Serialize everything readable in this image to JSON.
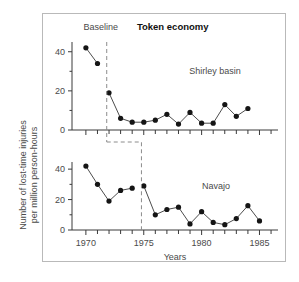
{
  "figure": {
    "title": "Token economy",
    "phase_labels": {
      "baseline": "Baseline",
      "treatment": "Token economy"
    },
    "axes": {
      "xlabel": "Years",
      "ylabel_line1": "Number of lost-time injuries",
      "ylabel_line2": "per million person-hours",
      "xticks_major": [
        1970,
        1975,
        1980,
        1985
      ],
      "xtick_labels": [
        "1970",
        "1975",
        "1980",
        "1985"
      ],
      "xlim": [
        1968.8,
        1986.6
      ],
      "yticks": [
        0,
        20,
        40
      ],
      "ytick_labels": [
        "0",
        "20",
        "40"
      ],
      "ylim": [
        0,
        46
      ],
      "grid": false
    }
  },
  "chart_data": {
    "type": "line",
    "title": "Token economy",
    "xlabel": "Years",
    "ylabel": "Number of lost-time injuries per million person-hours",
    "xlim": [
      1968.8,
      1986.6
    ],
    "ylim": [
      0,
      46
    ],
    "grid": false,
    "legend": "inline-labels",
    "panels": [
      {
        "name": "Shirley basin",
        "label": "Shirley basin",
        "intervention_year": 1971.8,
        "series": [
          {
            "name": "Baseline",
            "x": [
              1970,
              1971
            ],
            "values": [
              42,
              34
            ]
          },
          {
            "name": "Token economy",
            "x": [
              1972,
              1973,
              1974,
              1975,
              1976,
              1977,
              1978,
              1979,
              1980,
              1981,
              1982,
              1983,
              1984
            ],
            "values": [
              19,
              6,
              4,
              4,
              5,
              8,
              3,
              9,
              3.5,
              3.5,
              13,
              7,
              11
            ]
          }
        ]
      },
      {
        "name": "Navajo",
        "label": "Navajo",
        "intervention_year": 1974.8,
        "series": [
          {
            "name": "Baseline",
            "x": [
              1970,
              1971,
              1972,
              1973,
              1974
            ],
            "values": [
              42,
              30,
              19,
              26,
              27.5
            ]
          },
          {
            "name": "Token economy",
            "x": [
              1975,
              1976,
              1977,
              1978,
              1979,
              1980,
              1981,
              1982,
              1983,
              1984,
              1985
            ],
            "values": [
              29,
              10,
              13.5,
              15,
              4,
              12,
              5,
              3.5,
              7.5,
              16,
              6
            ]
          }
        ]
      }
    ]
  }
}
